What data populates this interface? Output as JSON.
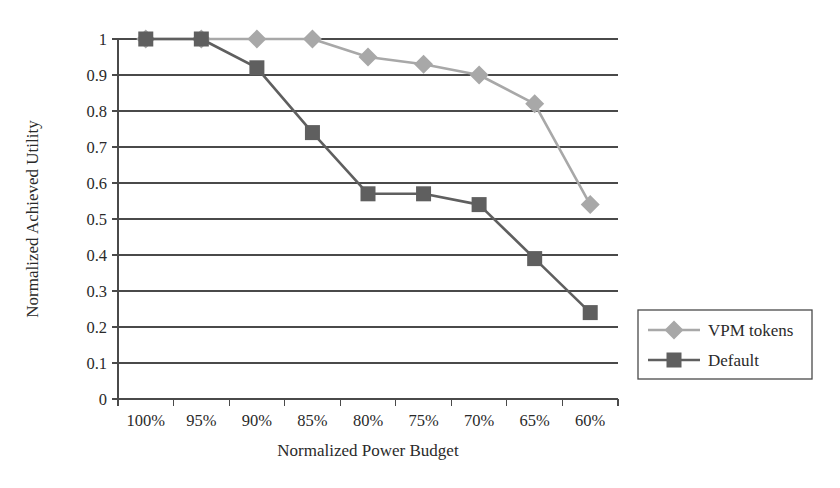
{
  "chart_data": {
    "type": "line",
    "title": "",
    "xlabel": "Normalized Power Budget",
    "ylabel": "Normalized Achieved Utility",
    "categories": [
      "100%",
      "95%",
      "90%",
      "85%",
      "80%",
      "75%",
      "70%",
      "65%",
      "60%"
    ],
    "ylim": [
      0,
      1
    ],
    "ytick_labels": [
      "1",
      "0.9",
      "0.8",
      "0.7",
      "0.6",
      "0.5",
      "0.4",
      "0.3",
      "0.2",
      "0.1",
      "0"
    ],
    "ytick_values": [
      1,
      0.9,
      0.8,
      0.7,
      0.6,
      0.5,
      0.4,
      0.3,
      0.2,
      0.1,
      0
    ],
    "grid": "horizontal",
    "legend_position": "right",
    "series": [
      {
        "name": "VPM tokens",
        "marker": "diamond",
        "color": "#a8a8a8",
        "values": [
          1,
          1,
          1,
          1,
          0.95,
          0.93,
          0.9,
          0.82,
          0.54
        ]
      },
      {
        "name": "Default",
        "marker": "square",
        "color": "#5f5f5f",
        "values": [
          1,
          1,
          0.92,
          0.74,
          0.57,
          0.57,
          0.54,
          0.39,
          0.24
        ]
      }
    ]
  },
  "legend": {
    "items": [
      {
        "label": "VPM tokens"
      },
      {
        "label": "Default"
      }
    ]
  },
  "colors": {
    "vpm_tokens": "#a8a8a8",
    "default_series": "#5f5f5f",
    "axis": "#4a4a4a",
    "text": "#2a2a2a",
    "background": "#ffffff"
  }
}
